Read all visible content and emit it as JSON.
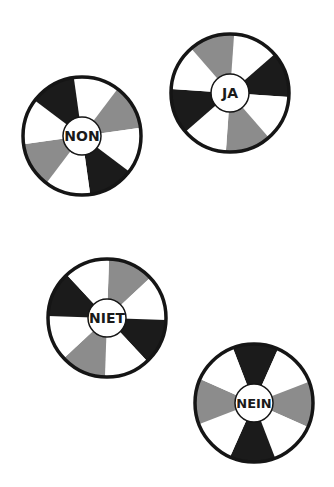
{
  "colors": {
    "black": "#1b1b1b",
    "gray": "#8c8c8c",
    "white": "#ffffff",
    "outline": "#151515",
    "background": "#ffffff"
  },
  "wheels": [
    {
      "label": "NON",
      "cx": 82,
      "cy": 136,
      "r": 59,
      "inner_r": 19,
      "start_angle": -8,
      "segments": [
        "white",
        "gray",
        "white",
        "black",
        "white",
        "gray",
        "white",
        "black"
      ],
      "font_size": 14
    },
    {
      "label": "JA",
      "cx": 230,
      "cy": 93,
      "r": 59,
      "inner_r": 19,
      "start_angle": 4,
      "segments": [
        "white",
        "black",
        "white",
        "gray",
        "white",
        "black",
        "white",
        "gray"
      ],
      "font_size": 14
    },
    {
      "label": "NIET",
      "cx": 107,
      "cy": 318,
      "r": 59,
      "inner_r": 19,
      "start_angle": 2,
      "segments": [
        "gray",
        "white",
        "black",
        "white",
        "gray",
        "white",
        "black",
        "white"
      ],
      "font_size": 14
    },
    {
      "label": "NEIN",
      "cx": 254,
      "cy": 403,
      "r": 59,
      "inner_r": 19,
      "start_angle": -21,
      "segments": [
        "black",
        "white",
        "gray",
        "white",
        "black",
        "white",
        "gray",
        "white"
      ],
      "font_size": 13
    }
  ]
}
